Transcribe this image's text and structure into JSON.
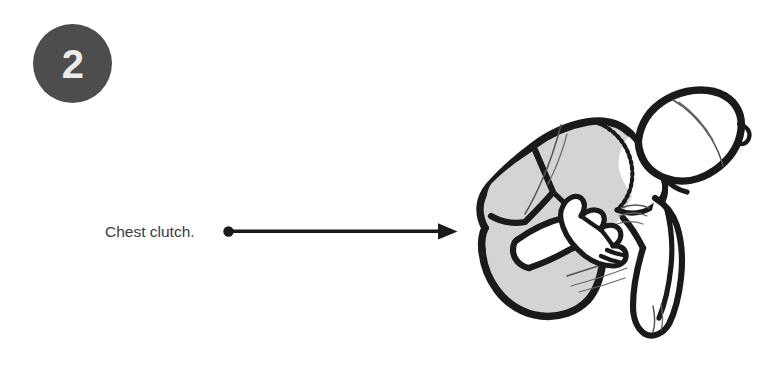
{
  "page": {
    "width": 782,
    "height": 367,
    "background_color": "#ffffff"
  },
  "step": {
    "number": "2",
    "badge_color": "#4d4d4d",
    "number_color": "#ececec"
  },
  "callout": {
    "label": "Chest clutch.",
    "text_color": "#3b3b3b",
    "leader": {
      "icon": "arrow-right-icon",
      "color": "#1a1a1a",
      "start_dot_x": 228,
      "tip_x": 457,
      "y": 231
    }
  },
  "illustration": {
    "name": "person-clutching-chest-line-art",
    "description": "Hunched figure in a gray t-shirt, head tilted back and to the right, one hand clutching the chest, the other arm hanging down.",
    "colors": {
      "outline": "#1a1a1a",
      "shirt_fill": "#d4d4d4",
      "skin_fill": "#ffffff",
      "detail_line": "#555555"
    },
    "parts": [
      "head",
      "hair-part-line",
      "neck",
      "t-shirt",
      "stitched-collar",
      "left-sleeve",
      "clutching-hand",
      "hanging-arm",
      "fist",
      "shirt-hem-folds"
    ]
  }
}
